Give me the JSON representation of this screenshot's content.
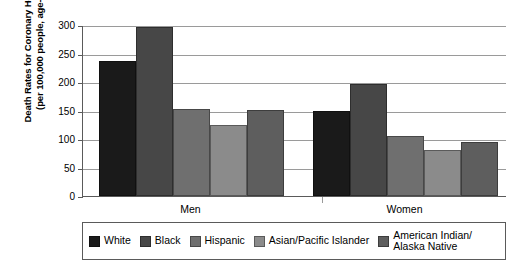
{
  "chart_data": {
    "type": "bar",
    "title": "",
    "xlabel": "",
    "ylabel_line1": "Death Rates for Coronary Heart Disease",
    "ylabel_line2": "(per 100,000 people, age-adjusted)",
    "categories": [
      "Men",
      "Women"
    ],
    "ylim": [
      0,
      300
    ],
    "yticks": [
      0,
      50,
      100,
      150,
      200,
      250,
      300
    ],
    "ytick_labels": [
      "0",
      "50",
      "100",
      "150",
      "200",
      "250",
      "300"
    ],
    "grid": "horizontal",
    "legend_position": "bottom",
    "series": [
      {
        "name": "White",
        "color": "#1a1a1a",
        "values": [
          236,
          149
        ]
      },
      {
        "name": "Black",
        "color": "#474747",
        "values": [
          296,
          197
        ]
      },
      {
        "name": "Hispanic",
        "color": "#6f6f6f",
        "values": [
          152,
          105
        ]
      },
      {
        "name": "Asian/Pacific Islander",
        "color": "#8b8b8b",
        "values": [
          124,
          81
        ]
      },
      {
        "name": "American Indian/\nAlaska Native",
        "color": "#5e5e5e",
        "values": [
          151,
          94
        ]
      }
    ]
  },
  "legend": {
    "items": [
      {
        "label": "White",
        "color": "#1a1a1a"
      },
      {
        "label": "Black",
        "color": "#474747"
      },
      {
        "label": "Hispanic",
        "color": "#6f6f6f"
      },
      {
        "label": "Asian/Pacific Islander",
        "color": "#8b8b8b"
      },
      {
        "label_line1": "American Indian/",
        "label_line2": "Alaska Native",
        "color": "#5e5e5e"
      }
    ]
  }
}
